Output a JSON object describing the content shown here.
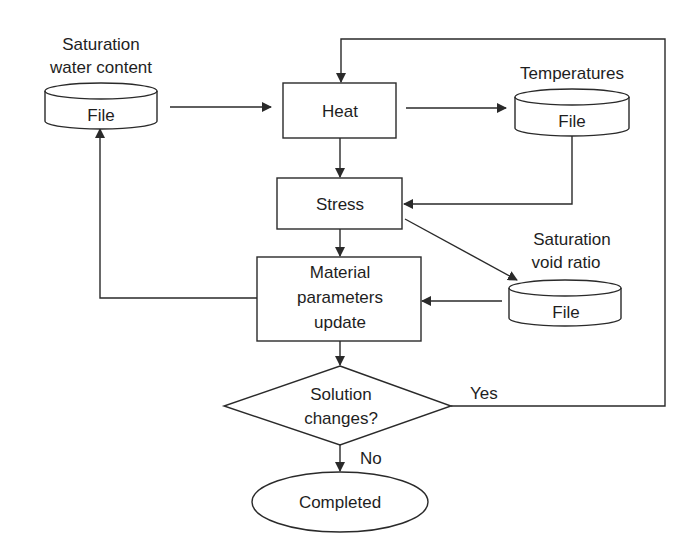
{
  "diagram": {
    "type": "flowchart",
    "colors": {
      "line": "#2a2a2a",
      "text": "#1e1e1e",
      "background": "#ffffff"
    },
    "nodes": {
      "sat_water": {
        "title_line1": "Saturation",
        "title_line2": "water content",
        "label": "File",
        "shape": "cylinder"
      },
      "heat": {
        "label": "Heat",
        "shape": "rectangle"
      },
      "temperatures": {
        "title": "Temperatures",
        "label": "File",
        "shape": "cylinder"
      },
      "stress": {
        "label": "Stress",
        "shape": "rectangle"
      },
      "sat_void": {
        "title_line1": "Saturation",
        "title_line2": "void ratio",
        "label": "File",
        "shape": "cylinder"
      },
      "material": {
        "line1": "Material",
        "line2": "parameters",
        "line3": "update",
        "shape": "rectangle"
      },
      "decision": {
        "line1": "Solution",
        "line2": "changes?",
        "shape": "diamond"
      },
      "completed": {
        "label": "Completed",
        "shape": "ellipse"
      }
    },
    "edge_labels": {
      "yes": "Yes",
      "no": "No"
    },
    "edges": [
      {
        "from": "sat_water",
        "to": "heat"
      },
      {
        "from": "heat",
        "to": "temperatures"
      },
      {
        "from": "heat",
        "to": "stress"
      },
      {
        "from": "temperatures",
        "to": "stress"
      },
      {
        "from": "stress",
        "to": "sat_void"
      },
      {
        "from": "stress",
        "to": "material"
      },
      {
        "from": "sat_void",
        "to": "material"
      },
      {
        "from": "material",
        "to": "sat_water"
      },
      {
        "from": "material",
        "to": "decision"
      },
      {
        "from": "decision",
        "to": "heat",
        "label": "Yes"
      },
      {
        "from": "decision",
        "to": "completed",
        "label": "No"
      }
    ]
  }
}
